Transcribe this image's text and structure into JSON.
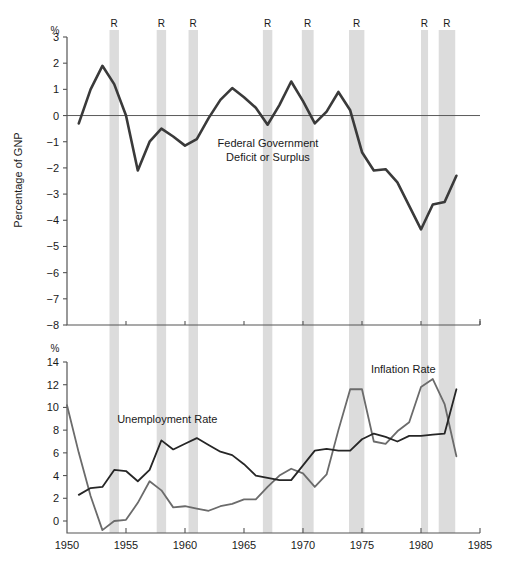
{
  "figure": {
    "title": "",
    "width": 510,
    "height": 576,
    "background": "#ffffff",
    "band_color": "#dcdcdc",
    "axis_color": "#555555",
    "dark_line_color": "#262626",
    "gray_line_color": "#666666"
  },
  "axis_titles": {
    "left_top": "Percentage of GNP",
    "percent_symbol_top": "%",
    "percent_symbol_bottom": "%"
  },
  "recession_label": "R",
  "recessions": [
    {
      "label": "R",
      "start": 1953.6,
      "end": 1954.4
    },
    {
      "label": "R",
      "start": 1957.6,
      "end": 1958.4
    },
    {
      "label": "R",
      "start": 1960.3,
      "end": 1961.1
    },
    {
      "label": "R",
      "start": 1969.9,
      "end": 1970.9
    },
    {
      "label": "R",
      "start": 1973.9,
      "end": 1975.2
    },
    {
      "label": "R",
      "start": 1980.0,
      "end": 1980.6
    },
    {
      "label": "R",
      "start": 1981.5,
      "end": 1982.9
    },
    {
      "label": "R",
      "start": 1966.6,
      "end": 1967.4
    }
  ],
  "chart_data": [
    {
      "type": "line",
      "id": "deficit-panel",
      "title": "Federal Government Deficit or Surplus",
      "annotation_lines": [
        "Federal Government",
        "Deficit or Surplus"
      ],
      "xlabel": "",
      "ylabel": "Percentage of GNP",
      "xlim": [
        1950,
        1985
      ],
      "ylim": [
        -8,
        3
      ],
      "yticks": [
        3,
        2,
        1,
        0,
        -1,
        -2,
        -3,
        -4,
        -5,
        -6,
        -7,
        -8
      ],
      "ytick_labels": [
        "3",
        "2",
        "1",
        "0",
        "-1",
        "-2",
        "-3",
        "-4",
        "-5",
        "-6",
        "-7",
        "-8"
      ],
      "xticks": [
        1950,
        1955,
        1960,
        1965,
        1970,
        1975,
        1980,
        1985
      ],
      "xtick_labels": [
        "1950",
        "1955",
        "1960",
        "1965",
        "1970",
        "1975",
        "1980",
        "1985"
      ],
      "grid": false,
      "zero_line": 0,
      "series": [
        {
          "name": "Federal Government Deficit or Surplus",
          "color": "#3a3a3a",
          "x": [
            1951,
            1952,
            1953,
            1954,
            1955,
            1956,
            1957,
            1958,
            1959,
            1960,
            1961,
            1962,
            1963,
            1964,
            1965,
            1966,
            1967,
            1968,
            1969,
            1970,
            1971,
            1972,
            1973,
            1974,
            1975,
            1976,
            1977,
            1978,
            1979,
            1980,
            1981,
            1982,
            1983
          ],
          "values": [
            -0.3,
            1.0,
            1.9,
            1.2,
            0.0,
            -2.1,
            -1.0,
            -0.5,
            -0.8,
            -1.15,
            -0.9,
            -0.1,
            0.6,
            1.05,
            0.7,
            0.3,
            -0.35,
            0.4,
            1.3,
            0.55,
            -0.3,
            0.15,
            0.9,
            0.2,
            -1.4,
            -2.1,
            -2.05,
            -2.55,
            -3.45,
            -4.35,
            -3.4,
            -3.3,
            -2.3,
            -7.4
          ]
        }
      ]
    },
    {
      "type": "line",
      "id": "rates-panel",
      "title": "",
      "xlabel": "",
      "ylabel": "",
      "xlim": [
        1950,
        1985
      ],
      "ylim": [
        0,
        14
      ],
      "yticks": [
        0,
        2,
        4,
        6,
        8,
        10,
        12,
        14
      ],
      "ytick_labels": [
        "0",
        "2",
        "4",
        "6",
        "8",
        "10",
        "12",
        "14"
      ],
      "xticks": [
        1950,
        1955,
        1960,
        1965,
        1970,
        1975,
        1980,
        1985
      ],
      "xtick_labels": [
        "1950",
        "1955",
        "1960",
        "1965",
        "1970",
        "1975",
        "1980",
        "1985"
      ],
      "grid": false,
      "series": [
        {
          "name": "Unemployment Rate",
          "color": "#262626",
          "label_x": 1958.5,
          "label_y": 8.6,
          "x": [
            1951,
            1952,
            1953,
            1954,
            1955,
            1956,
            1957,
            1958,
            1959,
            1960,
            1961,
            1962,
            1963,
            1964,
            1965,
            1966,
            1967,
            1968,
            1969,
            1970,
            1971,
            1972,
            1973,
            1974,
            1975,
            1976,
            1977,
            1978,
            1979,
            1980,
            1981,
            1982,
            1983
          ],
          "values": [
            2.3,
            2.9,
            3.0,
            4.5,
            4.4,
            3.5,
            4.5,
            7.1,
            6.3,
            6.8,
            7.3,
            6.7,
            6.1,
            5.8,
            5.0,
            4.0,
            3.8,
            3.6,
            3.6,
            4.9,
            6.2,
            6.35,
            6.2,
            6.2,
            7.2,
            7.7,
            7.4,
            7.0,
            7.5,
            7.5,
            7.6,
            7.7,
            11.6
          ]
        },
        {
          "name": "Inflation Rate",
          "color": "#6b6b6b",
          "label_x": 1978.5,
          "label_y": 13.0,
          "x": [
            1950,
            1951,
            1952,
            1953,
            1954,
            1955,
            1956,
            1957,
            1958,
            1959,
            1960,
            1961,
            1962,
            1963,
            1964,
            1965,
            1966,
            1967,
            1968,
            1969,
            1970,
            1971,
            1972,
            1973,
            1974,
            1975,
            1976,
            1977,
            1978,
            1979,
            1980,
            1981,
            1982,
            1983
          ],
          "values": [
            10.2,
            6.0,
            2.2,
            -0.8,
            0.0,
            0.1,
            1.6,
            3.5,
            2.7,
            1.2,
            1.3,
            1.1,
            0.9,
            1.3,
            1.5,
            1.9,
            1.9,
            3.0,
            4.0,
            4.6,
            4.2,
            3.0,
            4.1,
            8.0,
            11.6,
            11.6,
            7.0,
            6.8,
            7.9,
            8.7,
            11.8,
            12.5,
            10.3,
            5.7
          ]
        }
      ]
    }
  ]
}
